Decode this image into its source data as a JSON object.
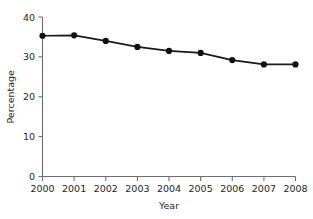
{
  "chart_data": {
    "type": "line",
    "title": "",
    "subtitle": "",
    "xlabel": "Year",
    "ylabel": "Percentage",
    "categories": [
      "2000",
      "2001",
      "2002",
      "2003",
      "2004",
      "2005",
      "2006",
      "2007",
      "2008"
    ],
    "x": [
      2000,
      2001,
      2002,
      2003,
      2004,
      2005,
      2006,
      2007,
      2008
    ],
    "values": [
      35.3,
      35.4,
      34.0,
      32.5,
      31.5,
      31.0,
      29.2,
      28.1,
      28.1
    ],
    "series": [
      {
        "name": "Percentage",
        "values": [
          35.3,
          35.4,
          34.0,
          32.5,
          31.5,
          31.0,
          29.2,
          28.1,
          28.1
        ]
      }
    ],
    "xlim": [
      2000,
      2008
    ],
    "ylim": [
      0,
      40
    ],
    "ytick_labels": [
      "0",
      "10",
      "20",
      "30",
      "40"
    ],
    "ytick_values": [
      0,
      10,
      20,
      30,
      40
    ],
    "xtick_labels": [
      "2000",
      "2001",
      "2002",
      "2003",
      "2004",
      "2005",
      "2006",
      "2007",
      "2008"
    ],
    "grid": false,
    "legend": false,
    "legend_position": "none",
    "marker": "filled-circle",
    "colors": {
      "line": "#1a1a1a",
      "marker": "#111111",
      "axis": "#6d6e71",
      "text": "#231f20",
      "background": "#ffffff"
    }
  },
  "axes": {
    "y": {
      "title": "Percentage",
      "ticks": [
        {
          "label": "40"
        },
        {
          "label": "30"
        },
        {
          "label": "20"
        },
        {
          "label": "10"
        },
        {
          "label": "0"
        }
      ]
    },
    "x": {
      "title": "Year",
      "ticks": [
        {
          "label": "2000"
        },
        {
          "label": "2001"
        },
        {
          "label": "2002"
        },
        {
          "label": "2003"
        },
        {
          "label": "2004"
        },
        {
          "label": "2005"
        },
        {
          "label": "2006"
        },
        {
          "label": "2007"
        },
        {
          "label": "2008"
        }
      ]
    }
  }
}
